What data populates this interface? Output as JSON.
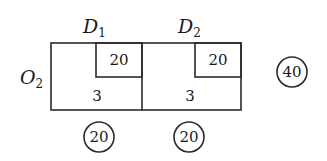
{
  "diagram": {
    "type": "transportation-table",
    "row_labels": [
      {
        "base": "O",
        "sub": "2"
      }
    ],
    "column_labels": [
      {
        "base": "D",
        "sub": "1"
      },
      {
        "base": "D",
        "sub": "2"
      }
    ],
    "cells": [
      {
        "column": "D1",
        "cost": "20",
        "allocation": "3"
      },
      {
        "column": "D2",
        "cost": "20",
        "allocation": "3"
      }
    ],
    "supply": "40",
    "demands": [
      "20",
      "20"
    ]
  },
  "colors": {
    "ink": "#1a1a1a",
    "background": "#ffffff"
  }
}
